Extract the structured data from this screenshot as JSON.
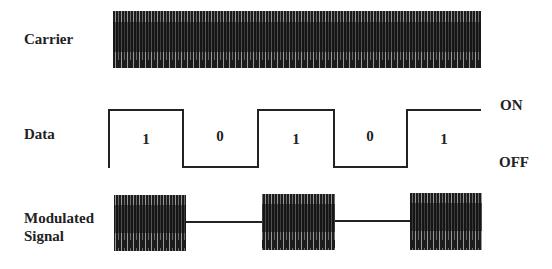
{
  "diagram": {
    "rows": {
      "carrier": {
        "label": "Carrier"
      },
      "data": {
        "label": "Data"
      },
      "modulated": {
        "label_line1": "Modulated",
        "label_line2": "Signal"
      }
    },
    "levels": {
      "on": "ON",
      "off": "OFF"
    },
    "bits": [
      {
        "value": "1",
        "level": "high",
        "x_start": 109,
        "x_end": 183
      },
      {
        "value": "0",
        "level": "low",
        "x_start": 183,
        "x_end": 258
      },
      {
        "value": "1",
        "level": "high",
        "x_start": 258,
        "x_end": 334
      },
      {
        "value": "0",
        "level": "low",
        "x_start": 334,
        "x_end": 407
      },
      {
        "value": "1",
        "level": "high",
        "x_start": 407,
        "x_end": 481
      }
    ],
    "colors": {
      "ink": "#222222",
      "background": "#ffffff"
    }
  }
}
